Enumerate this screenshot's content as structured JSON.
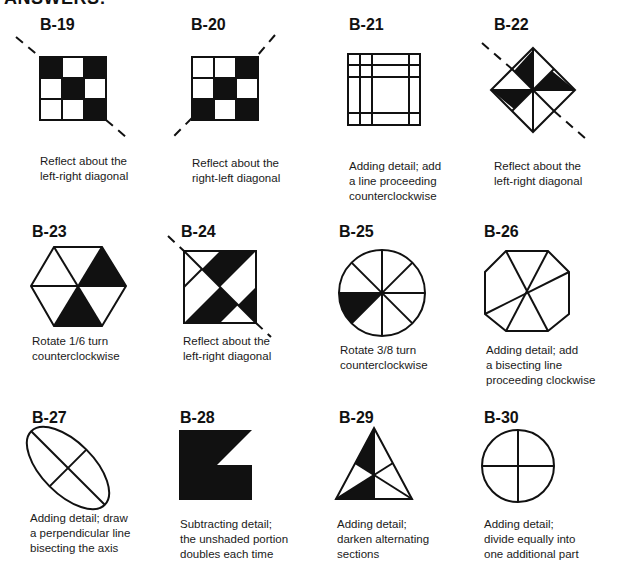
{
  "header": {
    "title": "ANSWERS:"
  },
  "items": [
    {
      "id": "B-19",
      "caption_lines": [
        "Reflect about the",
        "left-right diagonal"
      ]
    },
    {
      "id": "B-20",
      "caption_lines": [
        "Reflect about the",
        "right-left diagonal"
      ]
    },
    {
      "id": "B-21",
      "caption_lines": [
        "Adding detail; add",
        "a line proceeding",
        "counterclockwise"
      ]
    },
    {
      "id": "B-22",
      "caption_lines": [
        "Reflect about the",
        "left-right diagonal"
      ]
    },
    {
      "id": "B-23",
      "caption_lines": [
        "Rotate 1/6 turn",
        "counterclockwise"
      ]
    },
    {
      "id": "B-24",
      "caption_lines": [
        "Reflect about the",
        "left-right diagonal"
      ]
    },
    {
      "id": "B-25",
      "caption_lines": [
        "Rotate 3/8 turn",
        "counterclockwise"
      ]
    },
    {
      "id": "B-26",
      "caption_lines": [
        "Adding detail; add",
        "a bisecting line",
        "proceeding clockwise"
      ]
    },
    {
      "id": "B-27",
      "caption_lines": [
        "Adding detail; draw",
        "a perpendicular line",
        "bisecting the axis"
      ]
    },
    {
      "id": "B-28",
      "caption_lines": [
        "Subtracting detail;",
        "the unshaded portion",
        "doubles each time"
      ]
    },
    {
      "id": "B-29",
      "caption_lines": [
        "Adding detail;",
        "darken alternating",
        "sections"
      ]
    },
    {
      "id": "B-30",
      "caption_lines": [
        "Adding detail;",
        "divide equally into",
        "one additional part"
      ]
    }
  ],
  "colors": {
    "ink": "#111111",
    "paper": "#ffffff"
  }
}
